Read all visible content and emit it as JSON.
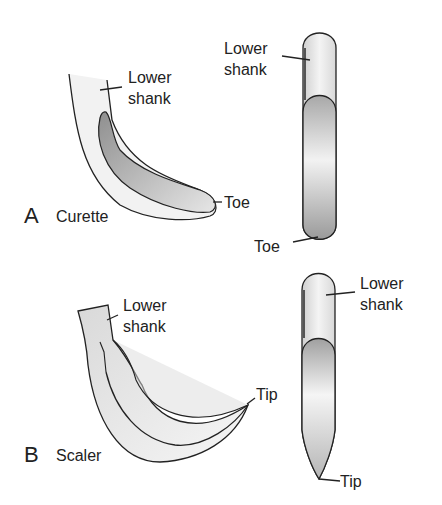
{
  "figure": {
    "panel_a": {
      "letter": "A",
      "title": "Curette",
      "labels": {
        "lower_shank_line1": "Lower",
        "lower_shank_line2": "shank",
        "toe_side": "Toe",
        "front_lower_shank_line1": "Lower",
        "front_lower_shank_line2": "shank",
        "toe_front": "Toe"
      }
    },
    "panel_b": {
      "letter": "B",
      "title": "Scaler",
      "labels": {
        "lower_shank_line1": "Lower",
        "lower_shank_line2": "shank",
        "tip_side": "Tip",
        "front_lower_shank_line1": "Lower",
        "front_lower_shank_line2": "shank",
        "tip_front": "Tip"
      }
    }
  }
}
